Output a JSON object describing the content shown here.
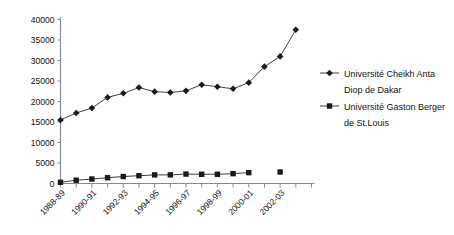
{
  "chart_data": {
    "type": "line",
    "title": "",
    "subtitle": "",
    "xlabel": "",
    "ylabel": "",
    "grid": false,
    "legend_position": "right",
    "ylim": [
      0,
      40000
    ],
    "yticks": [
      0,
      5000,
      10000,
      15000,
      20000,
      25000,
      30000,
      35000,
      40000
    ],
    "ytick_labels": [
      "0",
      "5000",
      "10000",
      "15000",
      "20000",
      "25000",
      "30000",
      "35000",
      "40000"
    ],
    "categories": [
      "1988-89",
      "1989-90",
      "1990-91",
      "1991-92",
      "1992-93",
      "1993-94",
      "1994-95",
      "1995-96",
      "1996-97",
      "1997-98",
      "1998-99",
      "1999-00",
      "2000-01",
      "2001-02",
      "2002-03",
      "2003-04"
    ],
    "xtick_labels_shown": [
      "1988-89",
      "1990-91",
      "1992-93",
      "1994-95",
      "1996-97",
      "1998-99",
      "2000-01",
      "2002-03"
    ],
    "series": [
      {
        "name": "Université Cheikh Anta Diop de Dakar",
        "marker": "diamond",
        "color": "#1a1a1a",
        "values": [
          15500,
          17200,
          18400,
          21000,
          22000,
          23400,
          22400,
          22200,
          22600,
          24100,
          23600,
          23100,
          24600,
          28500,
          31000,
          37500
        ]
      },
      {
        "name": "Université Gaston Berger de St.Louis",
        "marker": "square",
        "color": "#1a1a1a",
        "values": [
          300,
          800,
          1100,
          1400,
          1700,
          1900,
          2100,
          2100,
          2300,
          2250,
          2250,
          2400,
          2650,
          null,
          2800,
          null
        ]
      }
    ]
  },
  "legend": {
    "entries": [
      {
        "line1": "Université Cheikh Anta",
        "line2": "Diop de Dakar",
        "marker": "diamond"
      },
      {
        "line1": "Université Gaston Berger",
        "line2": "de St.Louis",
        "marker": "square"
      }
    ]
  }
}
